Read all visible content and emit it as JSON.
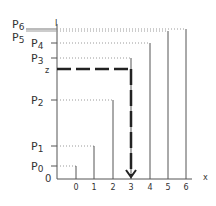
{
  "diagram": {
    "y_labels": [
      {
        "id": "P6",
        "main": "P",
        "sub": "6",
        "y": 28
      },
      {
        "id": "P5",
        "main": "P",
        "sub": "5",
        "y": 34
      },
      {
        "id": "P4",
        "main": "P",
        "sub": "4",
        "y": 43
      },
      {
        "id": "P3",
        "main": "P",
        "sub": "3",
        "y": 58
      },
      {
        "id": "P2",
        "main": "P",
        "sub": "2",
        "y": 100
      },
      {
        "id": "P1",
        "main": "P",
        "sub": "1",
        "y": 146
      },
      {
        "id": "P0",
        "main": "P",
        "sub": "0",
        "y": 166
      }
    ],
    "origin_label": "0",
    "z_label": "z",
    "top_tick_label": "I",
    "x_axis_label": "x",
    "x_ticks": [
      "0",
      "1",
      "2",
      "3",
      "4",
      "5",
      "6"
    ],
    "bars": [
      {
        "x_label": "0",
        "level": "P0"
      },
      {
        "x_label": "1",
        "level": "P1"
      },
      {
        "x_label": "2",
        "level": "P2"
      },
      {
        "x_label": "3",
        "level": "P3"
      },
      {
        "x_label": "4",
        "level": "P4"
      },
      {
        "x_label": "5",
        "level": "P5"
      },
      {
        "x_label": "6",
        "level": "P6"
      }
    ],
    "highlight": {
      "from": "z",
      "to_x": "3",
      "style": "dashed-arrow"
    },
    "colors": {
      "line": "#555555",
      "dotted": "#9a9a9a",
      "highlight": "#222222"
    }
  }
}
